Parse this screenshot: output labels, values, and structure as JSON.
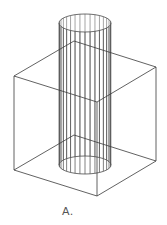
{
  "figure": {
    "caption": "A.",
    "stroke_color": "#3a3a3a",
    "cylinder_stroke_color": "#4a4a4a",
    "cube": {
      "top": [
        [
          74,
          41
        ],
        [
          156,
          67
        ],
        [
          97,
          102
        ],
        [
          14,
          76
        ]
      ],
      "bottom": [
        [
          74,
          135
        ],
        [
          156,
          161
        ],
        [
          97,
          196
        ],
        [
          14,
          170
        ]
      ]
    },
    "cylinder": {
      "cx": 85,
      "rx": 26,
      "ry": 9,
      "top_y": 23,
      "bottom_y": 165,
      "generator_lines": 32
    }
  }
}
